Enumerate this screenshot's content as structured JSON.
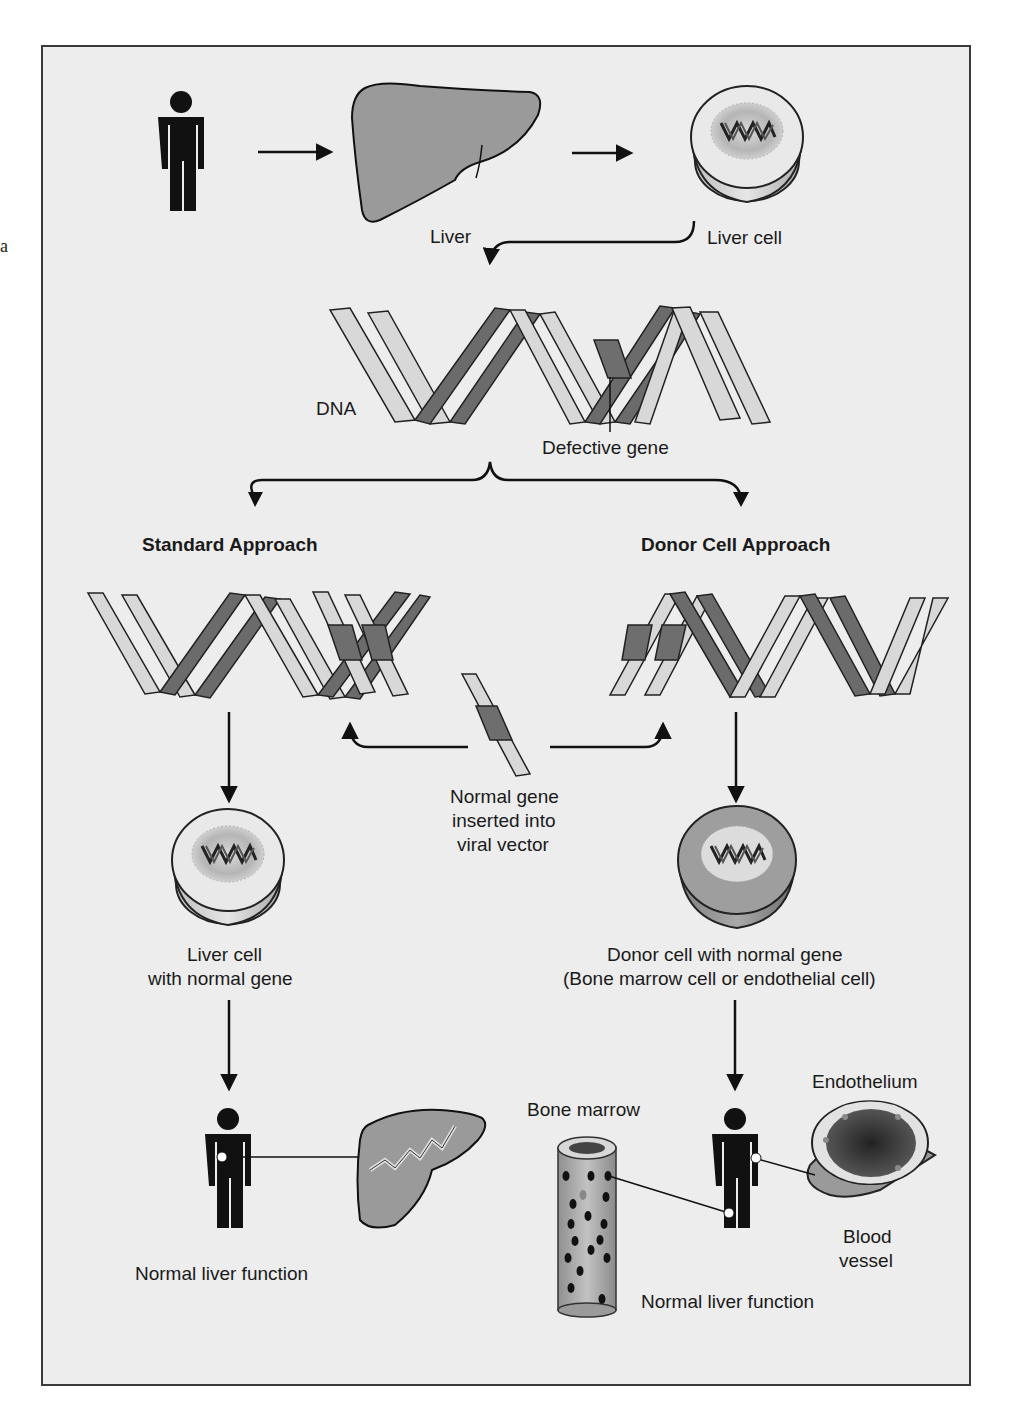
{
  "figure": {
    "colors": {
      "background": "#ededed",
      "frame": "#3a3a3a",
      "strand_light": "#d8d8d8",
      "strand_dark": "#6b6b6b",
      "gene_block": "#6e6e6e",
      "liver": "#9a9a9a",
      "person": "#111111"
    },
    "stray_margin_text": "a",
    "top_row": {
      "person_icon": "person-icon",
      "liver_label": "Liver",
      "liver_cell_label": "Liver cell"
    },
    "dna": {
      "label": "DNA",
      "defective_gene_label": "Defective gene"
    },
    "approaches": {
      "standard": {
        "title": "Standard Approach"
      },
      "donor": {
        "title": "Donor Cell Approach"
      }
    },
    "vector": {
      "label_line1": "Normal gene",
      "label_line2": "inserted into",
      "label_line3": "viral vector"
    },
    "standard_result": {
      "cell_label_line1": "Liver cell",
      "cell_label_line2": "with normal gene",
      "outcome_label": "Normal liver function"
    },
    "donor_result": {
      "cell_label_line1": "Donor cell with normal gene",
      "cell_label_line2": "(Bone marrow cell or endothelial cell)",
      "bone_marrow_label": "Bone marrow",
      "endothelium_label": "Endothelium",
      "blood_vessel_line1": "Blood",
      "blood_vessel_line2": "vessel",
      "outcome_label": "Normal liver function"
    }
  }
}
